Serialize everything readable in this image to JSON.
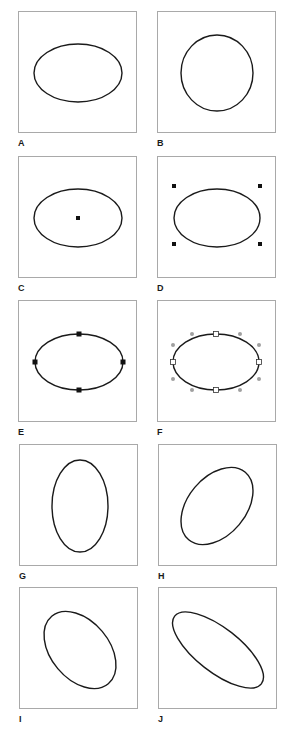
{
  "figure": {
    "stroke_color": "#1a1a1a",
    "frame_color": "#a9a9a9",
    "handle_color": "#111111",
    "anchor_open_fill": "#ffffff",
    "control_point_color": "#a0a0a0",
    "panels": [
      {
        "label": "A",
        "description": "ellipse"
      },
      {
        "label": "B",
        "description": "circle"
      },
      {
        "label": "C",
        "description": "ellipse with center point"
      },
      {
        "label": "D",
        "description": "ellipse with bounding corner handles"
      },
      {
        "label": "E",
        "description": "ellipse with anchor points"
      },
      {
        "label": "F",
        "description": "ellipse with anchor points and direction handles"
      },
      {
        "label": "G",
        "description": "vertical ellipse"
      },
      {
        "label": "H",
        "description": "ellipse rotated counter-clockwise"
      },
      {
        "label": "I",
        "description": "ellipse rotated clockwise"
      },
      {
        "label": "J",
        "description": "skewed elongated ellipse"
      }
    ]
  }
}
